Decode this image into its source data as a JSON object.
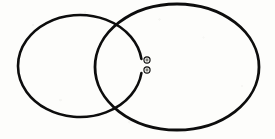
{
  "figure": {
    "background_color": "#fdfdfb",
    "stroke_color": "#0d0d0d",
    "canvas": {
      "width": 275,
      "height": 139
    }
  },
  "chart_data": {
    "type": "diagram",
    "xlabel": "",
    "ylabel": "",
    "grid": false,
    "legend": null,
    "annotations": [],
    "shapes": [
      {
        "name": "left-ring",
        "kind": "ellipse",
        "cx": 80,
        "cy": 66,
        "rx": 62,
        "ry": 51,
        "stroke": "#0d0d0d",
        "stroke_width": 2.6,
        "fill": "none",
        "gap": {
          "present": true,
          "side": "right",
          "start_deg": -8,
          "end_deg": 8,
          "description": "short break in the stroke on the right side of the left ring"
        }
      },
      {
        "name": "right-ring",
        "kind": "ellipse",
        "cx": 177,
        "cy": 67,
        "rx": 82,
        "ry": 63,
        "stroke": "#0d0d0d",
        "stroke_width": 2.8,
        "fill": "none",
        "gap": {
          "present": false
        }
      }
    ],
    "markers": [
      {
        "name": "upper-marker",
        "kind": "small-ring",
        "x": 147,
        "y": 60,
        "outer_radius": 3.1,
        "inner_radius": 1.4,
        "stroke": "#0d0d0d",
        "fill": "#e8e8e4"
      },
      {
        "name": "lower-marker",
        "kind": "small-ring",
        "x": 147,
        "y": 70,
        "outer_radius": 3.1,
        "inner_radius": 1.4,
        "stroke": "#0d0d0d",
        "fill": "#e8e8e4"
      }
    ],
    "intersections": [
      {
        "name": "upper-crossing",
        "x": 122,
        "y": 22
      },
      {
        "name": "lower-crossing",
        "x": 124,
        "y": 110
      }
    ]
  }
}
